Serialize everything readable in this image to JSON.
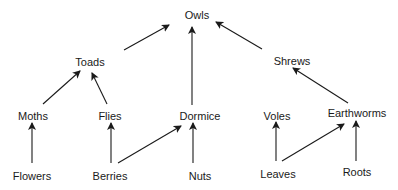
{
  "diagram": {
    "type": "food-web",
    "colors": {
      "text": "#1a1a1a",
      "arrow": "#1a1a1a",
      "background": "#ffffff"
    },
    "nodes": {
      "owls": {
        "label": "Owls",
        "x": 197,
        "y": 15
      },
      "toads": {
        "label": "Toads",
        "x": 90,
        "y": 62
      },
      "shrews": {
        "label": "Shrews",
        "x": 292,
        "y": 61
      },
      "moths": {
        "label": "Moths",
        "x": 33,
        "y": 116
      },
      "flies": {
        "label": "Flies",
        "x": 110,
        "y": 116
      },
      "dormice": {
        "label": "Dormice",
        "x": 200,
        "y": 116
      },
      "voles": {
        "label": "Voles",
        "x": 277,
        "y": 116
      },
      "earthworms": {
        "label": "Earthworms",
        "x": 357,
        "y": 113
      },
      "flowers": {
        "label": "Flowers",
        "x": 32,
        "y": 176
      },
      "berries": {
        "label": "Berries",
        "x": 110,
        "y": 176
      },
      "nuts": {
        "label": "Nuts",
        "x": 200,
        "y": 176
      },
      "leaves": {
        "label": "Leaves",
        "x": 278,
        "y": 174
      },
      "roots": {
        "label": "Roots",
        "x": 357,
        "y": 172
      }
    },
    "edges": [
      {
        "from": "toads",
        "to": "owls"
      },
      {
        "from": "dormice",
        "to": "owls"
      },
      {
        "from": "shrews",
        "to": "owls"
      },
      {
        "from": "moths",
        "to": "toads"
      },
      {
        "from": "flies",
        "to": "toads"
      },
      {
        "from": "earthworms",
        "to": "shrews"
      },
      {
        "from": "flowers",
        "to": "moths"
      },
      {
        "from": "berries",
        "to": "flies"
      },
      {
        "from": "berries",
        "to": "dormice"
      },
      {
        "from": "nuts",
        "to": "dormice"
      },
      {
        "from": "leaves",
        "to": "voles"
      },
      {
        "from": "leaves",
        "to": "earthworms"
      },
      {
        "from": "roots",
        "to": "earthworms"
      }
    ]
  }
}
